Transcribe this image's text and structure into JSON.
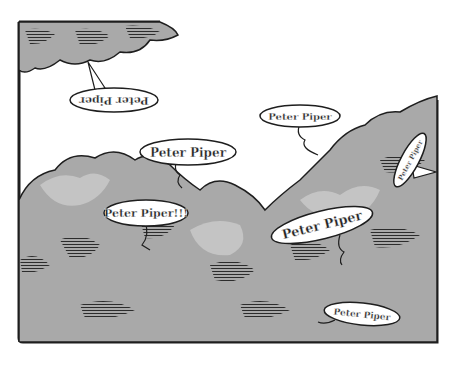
{
  "illustration": {
    "description": "Comic panel of bushy foliage with speech bubbles calling out",
    "colors": {
      "background": "#ffffff",
      "foliage": "#a9a9a9",
      "foliage_light": "#c4c4c4",
      "ink": "#1e1e1e",
      "bubble_fill": "#ffffff"
    },
    "speech_bubbles": [
      {
        "id": "tree-top-upside-down",
        "text": "Peter Piper",
        "orientation": "upside-down"
      },
      {
        "id": "upper-middle",
        "text": "Peter Piper",
        "orientation": "normal"
      },
      {
        "id": "upper-right",
        "text": "Peter Piper",
        "orientation": "normal"
      },
      {
        "id": "right-edge-vertical",
        "text": "Peter Piper",
        "orientation": "rotated"
      },
      {
        "id": "left-exclaim",
        "text": "Peter Piper!!!",
        "orientation": "normal"
      },
      {
        "id": "center-right-tilted",
        "text": "Peter Piper",
        "orientation": "tilted"
      },
      {
        "id": "bottom-right",
        "text": "Peter Piper",
        "orientation": "normal"
      }
    ]
  }
}
